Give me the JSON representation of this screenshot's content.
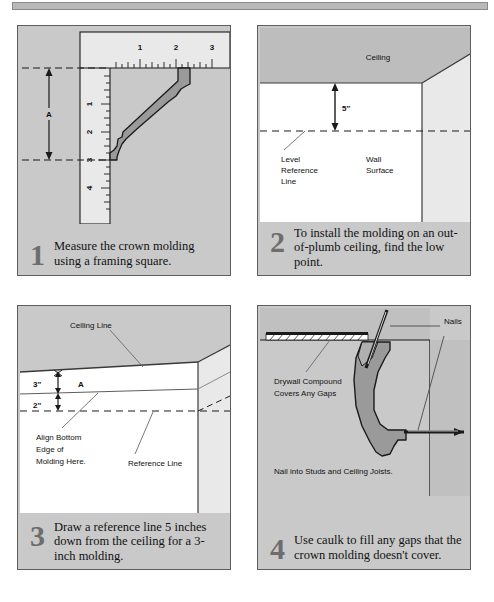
{
  "document": {
    "title": "Installing Crown Molding — 4 Step Illustrated Guide",
    "panel_count": 4
  },
  "colors": {
    "panel_background": "#c9c9c9",
    "panel_border": "#5e5e5e",
    "wall_white": "#ffffff",
    "wall_light": "#e8e8e8",
    "ceiling_gray": "#bdbdbd",
    "molding_fill": "#9a9a9a",
    "line_dark": "#1a1a1a",
    "step_number": "#6d6d6d",
    "top_rule": "#b9b9b9"
  },
  "panels": [
    {
      "id": "panel-1",
      "step_number": "1",
      "caption": "Measure the crown molding using a framing square.",
      "labels": {
        "dimension_a": "A",
        "ruler_horizontal_ticks": [
          "1",
          "2",
          "3"
        ],
        "ruler_vertical_ticks": [
          "1",
          "2",
          "3",
          "4"
        ]
      },
      "icon": "framing-square-with-crown-molding"
    },
    {
      "id": "panel-2",
      "step_number": "2",
      "caption": "To install the molding on an out-of-plumb ceiling, find the low point.",
      "labels": {
        "ceiling": "Ceiling",
        "dimension": "5\"",
        "level_reference_line": [
          "Level",
          "Reference",
          "Line"
        ],
        "wall_surface": [
          "Wall",
          "Surface"
        ]
      },
      "icon": "room-corner-with-level-line"
    },
    {
      "id": "panel-3",
      "step_number": "3",
      "caption": "Draw a reference line 5 inches down from the ceiling for a 3-inch molding.",
      "labels": {
        "ceiling_line": "Ceiling Line",
        "dim_top": "3\"",
        "dim_bottom": "2\"",
        "dimension_a": "A",
        "align_note": [
          "Align Bottom",
          "Edge of",
          "Molding Here."
        ],
        "reference_line": "Reference Line"
      },
      "icon": "wall-with-reference-line"
    },
    {
      "id": "panel-4",
      "step_number": "4",
      "caption": "Use caulk to fill any gaps that the crown molding doesn't cover.",
      "labels": {
        "nails": "Nails",
        "drywall_note": [
          "Drywall Compound",
          "Covers Any Gaps"
        ],
        "nail_note": "Nail into Studs and Ceiling Joists."
      },
      "icon": "installed-crown-molding-cross-section"
    }
  ]
}
